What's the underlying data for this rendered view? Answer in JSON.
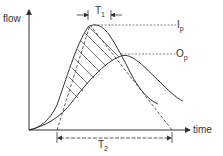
{
  "diagram": {
    "axes": {
      "y_label": "flow",
      "x_label": "time"
    },
    "curves": {
      "inflow_peak_label": "I",
      "inflow_peak_sub": "p",
      "outflow_peak_label": "O",
      "outflow_peak_sub": "p"
    },
    "dimensions": {
      "t1_label": "T",
      "t1_sub": "1",
      "t2_label": "T",
      "t2_sub": "2"
    },
    "colors": {
      "line": "#333333",
      "background": "#ffffff"
    }
  }
}
